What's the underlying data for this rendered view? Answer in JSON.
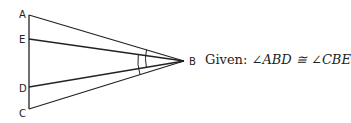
{
  "diagram": {
    "points": [
      {
        "name": "A",
        "x": 29,
        "y": 15,
        "lx": 19,
        "ly": 18
      },
      {
        "name": "E",
        "x": 29,
        "y": 39,
        "lx": 19,
        "ly": 43
      },
      {
        "name": "D",
        "x": 29,
        "y": 87,
        "lx": 19,
        "ly": 91
      },
      {
        "name": "C",
        "x": 29,
        "y": 109,
        "lx": 19,
        "ly": 117
      },
      {
        "name": "B",
        "x": 184,
        "y": 61,
        "lx": 191,
        "ly": 65
      }
    ],
    "labels": {
      "A": "A",
      "E": "E",
      "D": "D",
      "C": "C",
      "B": "B"
    },
    "stroke_color": "#222222"
  },
  "given": {
    "prefix": "Given:",
    "statement": "∠ABD ≅ ∠CBE"
  }
}
